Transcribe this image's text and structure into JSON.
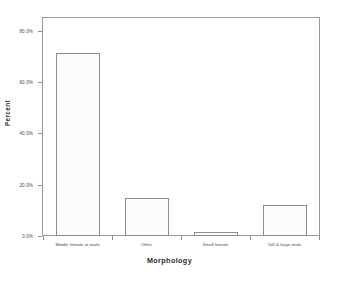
{
  "chart_data": {
    "type": "bar",
    "title": "",
    "subtitle": "",
    "xlabel": "Morphology",
    "ylabel": "Percent",
    "categories": [
      "Middle female or male",
      "Other",
      "Small female",
      "Tall & large male"
    ],
    "values": [
      71.5,
      15.0,
      1.5,
      12.0
    ],
    "value_labels": [
      "71.5%",
      "15.0%",
      "1.5%",
      "12.0%"
    ],
    "ylim": [
      0,
      85
    ],
    "ytick_values": [
      0,
      20,
      40,
      60,
      80
    ],
    "ytick_labels": [
      "0.0%",
      "20.0%",
      "40.0%",
      "60.0%",
      "80.0%"
    ],
    "grid": false,
    "legend": null,
    "bar_fill_color": "#fbfbfb",
    "bar_edge_color": "#8e8e8e",
    "frame_color": "#9a9a9a",
    "background_color": "#ffffff",
    "text_color": "#4a4a4a",
    "title_color": "#2b2b2b"
  }
}
